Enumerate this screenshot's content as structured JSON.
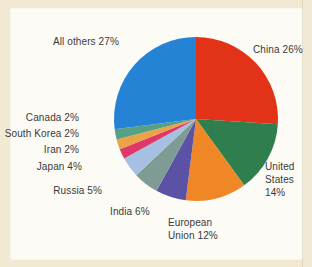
{
  "figure": {
    "background_color": "#f2e9d2",
    "panel_color": "#fcfbf6",
    "label_text_color": "#3a3a3a"
  },
  "chart_data": {
    "type": "pie",
    "title": "",
    "unit": "%",
    "start_angle_deg": -90,
    "direction": "clockwise",
    "total": 100,
    "slices": [
      {
        "label": "China",
        "value": 26,
        "color": "#e23318",
        "display": "China 26%"
      },
      {
        "label": "United States",
        "value": 14,
        "color": "#2f7f4e",
        "display": "United\nStates\n14%"
      },
      {
        "label": "European Union",
        "value": 12,
        "color": "#ef8726",
        "display": "European\nUnion 12%"
      },
      {
        "label": "India",
        "value": 6,
        "color": "#5c52a5",
        "display": "India 6%"
      },
      {
        "label": "Russia",
        "value": 5,
        "color": "#7f9c94",
        "display": "Russia 5%"
      },
      {
        "label": "Japan",
        "value": 4,
        "color": "#a5c0e0",
        "display": "Japan 4%"
      },
      {
        "label": "Iran",
        "value": 2,
        "color": "#e0376b",
        "display": "Iran 2%"
      },
      {
        "label": "South Korea",
        "value": 2,
        "color": "#eaa348",
        "display": "South Korea 2%"
      },
      {
        "label": "Canada",
        "value": 2,
        "color": "#57a083",
        "display": "Canada 2%"
      },
      {
        "label": "All others",
        "value": 27,
        "color": "#2583d6",
        "display": "All others 27%"
      }
    ]
  }
}
